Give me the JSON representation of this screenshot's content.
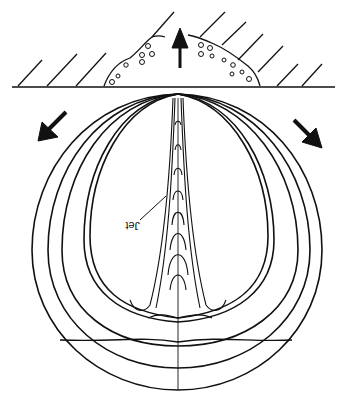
{
  "diagram": {
    "type": "schematic",
    "labels": {
      "jet": "Jet"
    },
    "elements": {
      "wall": "hatched solid boundary with eroded pit",
      "arrows": [
        "up (away from pit)",
        "down-left",
        "down-right"
      ],
      "contours": "nested collapsing bubble outlines with central jet"
    },
    "colors": {
      "ink": "#111111",
      "background": "#ffffff"
    }
  }
}
